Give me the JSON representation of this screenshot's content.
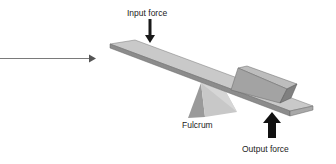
{
  "diagram": {
    "labels": {
      "input_force": "Input force",
      "fulcrum": "Fulcrum",
      "output_force": "Output force"
    },
    "colors": {
      "plank_top": "#c8c8c8",
      "plank_side": "#8a8a8a",
      "box_top": "#b5b5b5",
      "box_front": "#a0a0a0",
      "box_end": "#7e7e7e",
      "fulcrum_light": "#c4c4c4",
      "fulcrum_dark": "#8e8e8e",
      "force_arrow": "#1a1a1a",
      "pointer_arrow": "#777777"
    }
  }
}
